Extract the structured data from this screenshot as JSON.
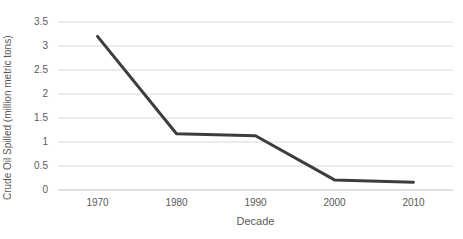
{
  "chart_data": {
    "type": "line",
    "categories": [
      "1970",
      "1980",
      "1990",
      "2000",
      "2010"
    ],
    "values": [
      3.2,
      1.17,
      1.13,
      0.21,
      0.16
    ],
    "series_name": "Crude oil spilled per decade",
    "xlabel": "Decade",
    "ylabel": "Crude Oil Spilled (million metric tons)",
    "ylim": [
      0,
      3.5
    ],
    "ytick_step": 0.5,
    "ytick_labels": [
      "0",
      "0.5",
      "1",
      "1.5",
      "2",
      "2.5",
      "3",
      "3.5"
    ],
    "grid": "horizontal",
    "legend": "none",
    "markers": "none",
    "colors": {
      "line": "#3d3d3d",
      "gridline": "#d9d9d9",
      "axis_line": "#bfbfbf",
      "text": "#595959",
      "background": "#ffffff"
    }
  }
}
